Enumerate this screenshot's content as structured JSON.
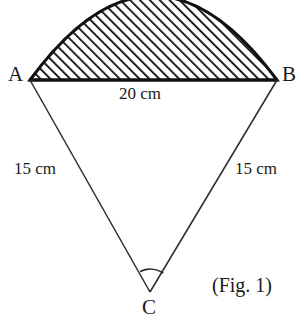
{
  "figure": {
    "caption": "(Fig. 1)",
    "vertices": [
      {
        "name": "A",
        "label": "A",
        "x": 30,
        "y": 80
      },
      {
        "name": "B",
        "label": "B",
        "x": 277,
        "y": 80
      },
      {
        "name": "C",
        "label": "C",
        "x": 150,
        "y": 292
      }
    ],
    "measures": {
      "chord": "20 cm",
      "left_side": "15 cm",
      "right_side": "15 cm"
    },
    "colors": {
      "stroke": "#1a1a1a",
      "hatch": "#000000",
      "background": "#ffffff"
    },
    "geometry": {
      "chord_y": 80,
      "chord_x1": 30,
      "chord_x2": 277,
      "arc_apex_y": 6,
      "apex_x": 150,
      "apex_y": 292,
      "angle_arc_radius": 12,
      "hatch_angle_deg": 45,
      "hatch_spacing_px": 7
    }
  }
}
